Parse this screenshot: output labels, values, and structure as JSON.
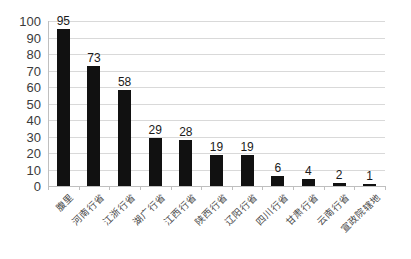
{
  "chart_data": {
    "type": "bar",
    "title": "",
    "xlabel": "",
    "ylabel": "",
    "ylim": [
      0,
      100
    ],
    "ytick_step": 10,
    "yticks": [
      0,
      10,
      20,
      30,
      40,
      50,
      60,
      70,
      80,
      90,
      100
    ],
    "grid": true,
    "grid_axis": "y",
    "legend": false,
    "legend_position": "none",
    "bar_color": "#111111",
    "gridline_color": "#d9d9d9",
    "axis_color": "#bfbfbf",
    "label_rotation_deg": -45,
    "show_value_labels": true,
    "categories": [
      "腹里",
      "河南行省",
      "江浙行省",
      "湖广行省",
      "江西行省",
      "陕西行省",
      "辽阳行省",
      "四川行省",
      "甘肃行省",
      "云南行省",
      "宣政院辖地"
    ],
    "values": [
      95,
      73,
      58,
      29,
      28,
      19,
      19,
      6,
      4,
      2,
      1
    ]
  }
}
